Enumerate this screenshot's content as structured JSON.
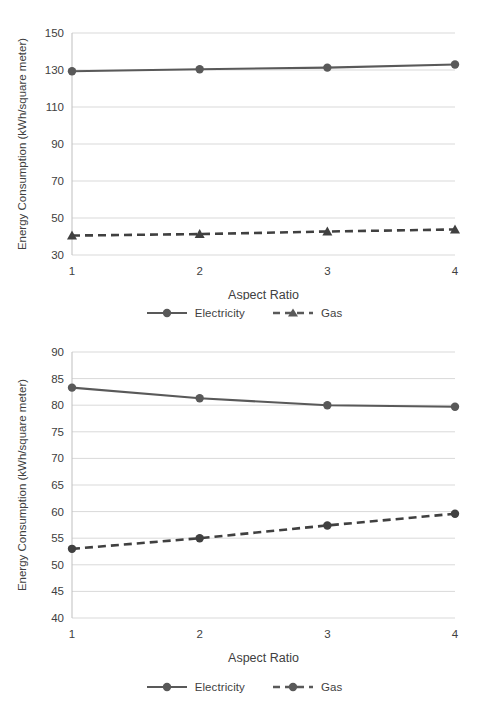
{
  "figure": {
    "background_color": "#ffffff",
    "series_color": "#595959",
    "gridline_color": "#d9d9d9",
    "text_color": "#404040"
  },
  "charts": [
    {
      "id": "top",
      "legend": [
        {
          "label": "Electricity",
          "marker": "circle",
          "line": "solid"
        },
        {
          "label": "Gas",
          "marker": "triangle",
          "line": "dashed"
        }
      ]
    },
    {
      "id": "bottom",
      "legend": [
        {
          "label": "Electricity",
          "marker": "circle",
          "line": "solid"
        },
        {
          "label": "Gas",
          "marker": "circle",
          "line": "dashed"
        }
      ]
    }
  ],
  "chart_data": [
    {
      "type": "line",
      "title": "",
      "xlabel": "Aspect Ratio",
      "ylabel": "Energy Consumption (kWh/square meter)",
      "categories": [
        "1",
        "2",
        "3",
        "4"
      ],
      "x": [
        1,
        2,
        3,
        4
      ],
      "ylim": [
        30,
        150
      ],
      "ytick_step": 20,
      "yticks": [
        30,
        50,
        70,
        90,
        110,
        130,
        150
      ],
      "ytick_labels": [
        "30",
        "50",
        "70",
        "90",
        "110",
        "130",
        "150"
      ],
      "grid": true,
      "grid_axis": "y",
      "legend_position": "bottom",
      "series": [
        {
          "name": "Electricity",
          "values": [
            129.3,
            130.4,
            131.3,
            133.0
          ],
          "marker": "circle",
          "line_style": "solid",
          "color": "#595959"
        },
        {
          "name": "Gas",
          "values": [
            40.5,
            41.3,
            42.7,
            43.8
          ],
          "marker": "triangle",
          "line_style": "dashed",
          "color": "#404040"
        }
      ]
    },
    {
      "type": "line",
      "title": "",
      "xlabel": "Aspect Ratio",
      "ylabel": "Energy Consumption (kWh/square meter)",
      "categories": [
        "1",
        "2",
        "3",
        "4"
      ],
      "x": [
        1,
        2,
        3,
        4
      ],
      "ylim": [
        40,
        90
      ],
      "ytick_step": 5,
      "yticks": [
        40,
        45,
        50,
        55,
        60,
        65,
        70,
        75,
        80,
        85,
        90
      ],
      "ytick_labels": [
        "40",
        "45",
        "50",
        "55",
        "60",
        "65",
        "70",
        "75",
        "80",
        "85",
        "90"
      ],
      "grid": true,
      "grid_axis": "y",
      "legend_position": "bottom",
      "series": [
        {
          "name": "Electricity",
          "values": [
            83.3,
            81.3,
            80.0,
            79.7
          ],
          "marker": "circle",
          "line_style": "solid",
          "color": "#595959"
        },
        {
          "name": "Gas",
          "values": [
            53.0,
            55.0,
            57.4,
            59.6
          ],
          "marker": "circle",
          "line_style": "dashed",
          "color": "#404040"
        }
      ]
    }
  ]
}
